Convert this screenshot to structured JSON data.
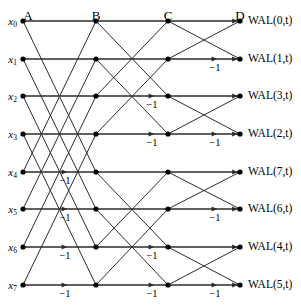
{
  "figure": {
    "width": 301,
    "height": 305,
    "line_color": "#2b2b2b",
    "node_color": "#000000",
    "text_color": "#000000"
  },
  "geometry": {
    "columns_x": [
      23,
      96,
      168,
      240
    ],
    "rows_y": [
      21,
      59,
      96,
      134,
      172,
      209,
      247,
      285
    ],
    "header_y": 9,
    "node_radius": 2.6
  },
  "columns": [
    {
      "id": "A",
      "label": "A"
    },
    {
      "id": "B",
      "label": "B"
    },
    {
      "id": "C",
      "label": "C"
    },
    {
      "id": "D",
      "label": "D"
    }
  ],
  "inputs": [
    {
      "base": "x",
      "sub": "0"
    },
    {
      "base": "x",
      "sub": "1"
    },
    {
      "base": "x",
      "sub": "2"
    },
    {
      "base": "x",
      "sub": "3"
    },
    {
      "base": "x",
      "sub": "4"
    },
    {
      "base": "x",
      "sub": "5"
    },
    {
      "base": "x",
      "sub": "6"
    },
    {
      "base": "x",
      "sub": "7"
    }
  ],
  "outputs": [
    {
      "label": "WAL(0,t)",
      "index": 0
    },
    {
      "label": "WAL(1,t)",
      "index": 1
    },
    {
      "label": "WAL(3,t)",
      "index": 3
    },
    {
      "label": "WAL(2,t)",
      "index": 2
    },
    {
      "label": "WAL(7,t)",
      "index": 7
    },
    {
      "label": "WAL(6,t)",
      "index": 6
    },
    {
      "label": "WAL(4,t)",
      "index": 4
    },
    {
      "label": "WAL(5,t)",
      "index": 5
    }
  ],
  "stages": [
    {
      "name": "stage-a-b",
      "from_col": 0,
      "to_col": 1,
      "pairs": [
        [
          0,
          4
        ],
        [
          1,
          5
        ],
        [
          2,
          6
        ],
        [
          3,
          7
        ]
      ],
      "straight_rows": [
        0,
        1,
        2,
        3,
        4,
        5,
        6,
        7
      ],
      "minus_rows": [
        4,
        5,
        6,
        7
      ],
      "minus_x": 65,
      "minus_label": "−1"
    },
    {
      "name": "stage-b-c",
      "from_col": 1,
      "to_col": 2,
      "pairs": [
        [
          0,
          2
        ],
        [
          1,
          3
        ],
        [
          4,
          6
        ],
        [
          5,
          7
        ]
      ],
      "straight_rows": [
        0,
        1,
        2,
        3,
        4,
        5,
        6,
        7
      ],
      "minus_rows": [
        2,
        3,
        6,
        7
      ],
      "minus_x": 152,
      "minus_label": "−1"
    },
    {
      "name": "stage-c-d",
      "from_col": 2,
      "to_col": 3,
      "pairs": [
        [
          0,
          1
        ],
        [
          2,
          3
        ],
        [
          4,
          5
        ],
        [
          6,
          7
        ]
      ],
      "straight_rows": [
        0,
        1,
        2,
        3,
        4,
        5,
        6,
        7
      ],
      "minus_rows": [
        1,
        3,
        5,
        7
      ],
      "minus_x": 215,
      "minus_label": "−1"
    }
  ]
}
